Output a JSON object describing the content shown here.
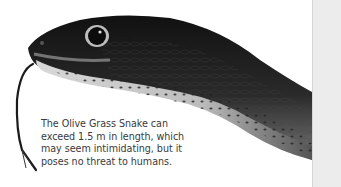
{
  "page": {
    "background": "#ffffff",
    "right_strip_color": "#ececec"
  },
  "photo": {
    "subject": "Olive Grass Snake head, grayscale",
    "icon": "snake-photo"
  },
  "caption": {
    "lines": [
      "The Olive Grass Snake can",
      "exceed 1.5 m in length, which",
      "may seem intimidating, but it",
      "poses no threat to humans."
    ]
  }
}
